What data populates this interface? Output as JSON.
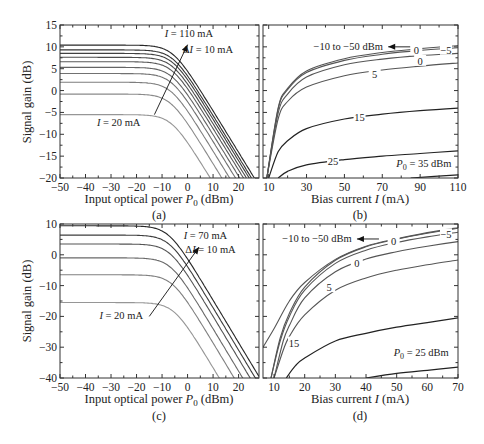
{
  "figure": {
    "ylabel_top": "Signal gain (dB)",
    "ylabel_bottom": "Signal gain (dB)"
  },
  "chart_data": [
    {
      "id": "a",
      "type": "line",
      "caption": "(a)",
      "title": "",
      "xlabel": "Input optical power P0 (dBm)",
      "ylabel": "Signal gain (dB)",
      "xlim": [
        -50,
        28
      ],
      "ylim": [
        -20,
        15
      ],
      "xticks": [
        -50,
        -40,
        -30,
        -20,
        -10,
        0,
        10,
        20
      ],
      "yticks": [
        -20,
        -15,
        -10,
        -5,
        0,
        5,
        10,
        15
      ],
      "grid": false,
      "legend": null,
      "annotations": [
        {
          "text": "I = 110 mA",
          "x": 0.5,
          "y": 12.3
        },
        {
          "text": "ΔI = 10 mA",
          "x": 8,
          "y": 8.5
        },
        {
          "text": "I = 20 mA",
          "x": -27,
          "y": -8
        },
        {
          "arrow": {
            "from": [
              -13,
              -5.5
            ],
            "to": [
              0,
              10.5
            ]
          }
        }
      ],
      "series_description": "Gain saturation curves for bias currents I = 20 to 110 mA in 10 mA steps; flat small-signal gain then roll-off above about -10 dBm",
      "series": [
        {
          "name": "I = 20 mA",
          "small_signal_gain": -5.5,
          "psat": 4
        },
        {
          "name": "I = 30 mA",
          "small_signal_gain": -0.8,
          "psat": 5
        },
        {
          "name": "I = 40 mA",
          "small_signal_gain": 1.9,
          "psat": 6
        },
        {
          "name": "I = 50 mA",
          "small_signal_gain": 3.9,
          "psat": 6.8
        },
        {
          "name": "I = 60 mA",
          "small_signal_gain": 5.3,
          "psat": 7.4
        },
        {
          "name": "I = 70 mA",
          "small_signal_gain": 6.6,
          "psat": 7.9
        },
        {
          "name": "I = 80 mA",
          "small_signal_gain": 7.6,
          "psat": 8.3
        },
        {
          "name": "I = 90 mA",
          "small_signal_gain": 8.5,
          "psat": 8.7
        },
        {
          "name": "I = 100 mA",
          "small_signal_gain": 9.3,
          "psat": 9.0
        },
        {
          "name": "I = 110 mA",
          "small_signal_gain": 10.4,
          "psat": 9.3
        }
      ]
    },
    {
      "id": "b",
      "type": "line",
      "caption": "(b)",
      "xlabel": "Bias current I (mA)",
      "ylabel": "Signal gain (dB)",
      "xlim": [
        7,
        110
      ],
      "ylim": [
        -20,
        15
      ],
      "xticks": [
        10,
        30,
        50,
        70,
        90,
        110
      ],
      "yticks": [
        -20,
        -15,
        -10,
        -5,
        0,
        5,
        10,
        15
      ],
      "grid": false,
      "annotations": [
        {
          "text": "−10 to −50 dBm",
          "x": 52,
          "y": 9.2
        },
        {
          "text": "P0 = 35 dBm",
          "x": 92,
          "y": -17.5
        }
      ],
      "series": [
        {
          "name": "-10 to -50 dBm",
          "label": "0",
          "x": [
            9,
            15,
            20,
            30,
            50,
            70,
            90,
            110
          ],
          "y": [
            -20,
            -4,
            0.5,
            4.5,
            7.3,
            8.7,
            9.6,
            10.3
          ]
        },
        {
          "name": "-5 dBm",
          "label": "−5",
          "x": [
            9,
            15,
            20,
            30,
            50,
            70,
            90,
            110
          ],
          "y": [
            -20,
            -4.3,
            0.2,
            4.1,
            6.9,
            8.3,
            9.2,
            9.8
          ]
        },
        {
          "name": "0 dBm",
          "label": "0",
          "x": [
            9,
            15,
            20,
            30,
            50,
            70,
            90,
            110
          ],
          "y": [
            -20,
            -5.2,
            -0.8,
            3.1,
            5.9,
            7.2,
            8.0,
            8.5
          ]
        },
        {
          "name": "5 dBm",
          "label": "5",
          "x": [
            9,
            15,
            20,
            30,
            50,
            70,
            90,
            110
          ],
          "y": [
            -20,
            -6.5,
            -2.5,
            0.8,
            3.4,
            4.7,
            5.6,
            6.3
          ]
        },
        {
          "name": "15 dBm",
          "label": "15",
          "x": [
            10,
            15,
            20,
            30,
            50,
            70,
            90,
            110
          ],
          "y": [
            -20,
            -14,
            -11.5,
            -8.7,
            -6.5,
            -5.4,
            -4.6,
            -4.0
          ]
        },
        {
          "name": "25 dBm",
          "label": "25",
          "x": [
            15,
            20,
            30,
            50,
            70,
            90,
            110
          ],
          "y": [
            -20,
            -18.5,
            -17,
            -15.8,
            -15,
            -14.4,
            -13.8
          ]
        },
        {
          "name": "35 dBm",
          "label": "P0 = 35 dBm",
          "x": [
            85,
            110
          ],
          "y": [
            -20,
            -19.3
          ]
        }
      ]
    },
    {
      "id": "c",
      "type": "line",
      "caption": "(c)",
      "xlabel": "Input optical power P0 (dBm)",
      "ylabel": "Signal gain (dB)",
      "xlim": [
        -50,
        28
      ],
      "ylim": [
        -40,
        10
      ],
      "xticks": [
        -50,
        -40,
        -30,
        -20,
        -10,
        0,
        10,
        20
      ],
      "yticks": [
        -40,
        -30,
        -20,
        -10,
        0,
        10
      ],
      "grid": false,
      "annotations": [
        {
          "text": "I = 70 mA",
          "x": 7,
          "y": 5
        },
        {
          "text": "ΔI = 10 mA",
          "x": 9,
          "y": 0.5
        },
        {
          "text": "I = 20 mA",
          "x": -26,
          "y": -21
        },
        {
          "arrow": {
            "from": [
              -15,
              -20
            ],
            "to": [
              4.5,
              2.5
            ]
          }
        }
      ],
      "series": [
        {
          "name": "I = 20 mA",
          "small_signal_gain": -15.5,
          "psat": 2
        },
        {
          "name": "I = 30 mA",
          "small_signal_gain": -6.5,
          "psat": 4
        },
        {
          "name": "I = 40 mA",
          "small_signal_gain": -1.0,
          "psat": 5
        },
        {
          "name": "I = 50 mA",
          "small_signal_gain": 3.5,
          "psat": 6
        },
        {
          "name": "I = 60 mA",
          "small_signal_gain": 6.4,
          "psat": 6.8
        },
        {
          "name": "I = 70 mA",
          "small_signal_gain": 9.4,
          "psat": 7.3
        }
      ]
    },
    {
      "id": "d",
      "type": "line",
      "caption": "(d)",
      "xlabel": "Bias current I (mA)",
      "ylabel": "Signal gain (dB)",
      "xlim": [
        6.4,
        70
      ],
      "ylim": [
        -40,
        10
      ],
      "xticks": [
        10,
        20,
        30,
        40,
        50,
        60,
        70
      ],
      "yticks": [
        -40,
        -30,
        -20,
        -10,
        0,
        10
      ],
      "grid": false,
      "annotations": [
        {
          "text": "−10 to −50 dBm",
          "x": 24,
          "y": 4
        },
        {
          "text": "P0 = 25 dBm",
          "x": 58,
          "y": -33
        }
      ],
      "series": [
        {
          "name": "-50 dBm",
          "x": [
            6.4,
            10,
            15,
            20,
            30,
            40,
            50,
            60,
            70
          ],
          "y": [
            -30,
            -24,
            -15,
            -9,
            -1.5,
            2.8,
            5.2,
            7.2,
            8.8
          ]
        },
        {
          "name": "-10 to -50 dBm",
          "label": "0",
          "x": [
            9,
            12,
            15,
            20,
            30,
            40,
            50,
            60,
            70
          ],
          "y": [
            -40,
            -27,
            -19,
            -10.5,
            -1.8,
            2.6,
            5.1,
            7.0,
            8.6
          ]
        },
        {
          "name": "-5 dBm",
          "label": "−5",
          "x": [
            9,
            12,
            15,
            20,
            30,
            40,
            50,
            60,
            70
          ],
          "y": [
            -40,
            -28,
            -20,
            -11.5,
            -2.8,
            1.5,
            4.0,
            5.8,
            7.3
          ]
        },
        {
          "name": "0 dBm",
          "label": "0",
          "x": [
            10,
            13,
            15,
            20,
            30,
            40,
            50,
            60,
            70
          ],
          "y": [
            -40,
            -28,
            -23,
            -14,
            -5.5,
            -1.4,
            1.0,
            2.8,
            4.3
          ]
        },
        {
          "name": "5 dBm",
          "label": "5",
          "x": [
            10,
            13,
            15,
            20,
            30,
            40,
            50,
            60,
            70
          ],
          "y": [
            -40,
            -31,
            -26.5,
            -19.5,
            -11.5,
            -7.5,
            -5.0,
            -3.2,
            -1.7
          ]
        },
        {
          "name": "15 dBm",
          "label": "15",
          "x": [
            14,
            17,
            20,
            30,
            40,
            50,
            60,
            70
          ],
          "y": [
            -40,
            -36,
            -33.5,
            -28,
            -25.5,
            -23.5,
            -22,
            -20.5
          ]
        },
        {
          "name": "25 dBm",
          "label": "P0 = 25 dBm",
          "x": [
            40,
            50,
            60,
            70
          ],
          "y": [
            -40,
            -38.5,
            -37.5,
            -36.5
          ]
        }
      ]
    }
  ]
}
